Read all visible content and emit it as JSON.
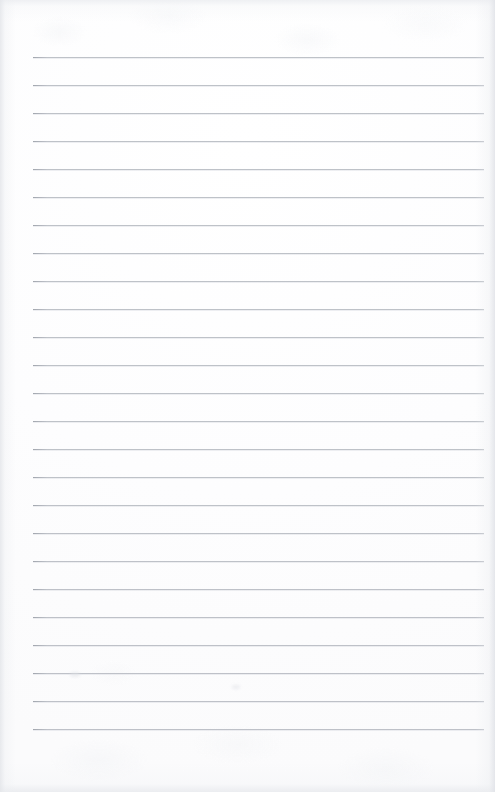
{
  "document": {
    "kind": "lined-paper-scan",
    "title": "Blank ruled notepad page",
    "description": "A scanned blank sheet of ruled (lined) writing paper. No text, headings, or marks are present — only horizontal ruling lines on near-white paper.",
    "page_width": 495,
    "page_height": 792,
    "content_text": "",
    "has_text": false,
    "has_margin_rule": false,
    "has_holes": false
  },
  "paper": {
    "background_color": "#fdfdfe",
    "edge_shadow_color": "#e4e6ea",
    "texture_note": "faint mottled scanner texture at top and bottom edges"
  },
  "ruling": {
    "line_color": "#b9bdc4",
    "line_thickness_px": 1,
    "line_count": 25,
    "line_spacing_px": 28,
    "first_line_y": 57,
    "last_line_y": 729,
    "line_start_x": 33,
    "line_end_x": 484,
    "line_length_px": 451,
    "left_margin_px": 33,
    "right_margin_px": 11,
    "top_margin_px": 57,
    "bottom_margin_px": 63,
    "lines": [
      {
        "index": 1,
        "y": 57,
        "content": ""
      },
      {
        "index": 2,
        "y": 85,
        "content": ""
      },
      {
        "index": 3,
        "y": 113,
        "content": ""
      },
      {
        "index": 4,
        "y": 141,
        "content": ""
      },
      {
        "index": 5,
        "y": 169,
        "content": ""
      },
      {
        "index": 6,
        "y": 197,
        "content": ""
      },
      {
        "index": 7,
        "y": 225,
        "content": ""
      },
      {
        "index": 8,
        "y": 253,
        "content": ""
      },
      {
        "index": 9,
        "y": 281,
        "content": ""
      },
      {
        "index": 10,
        "y": 309,
        "content": ""
      },
      {
        "index": 11,
        "y": 337,
        "content": ""
      },
      {
        "index": 12,
        "y": 365,
        "content": ""
      },
      {
        "index": 13,
        "y": 393,
        "content": ""
      },
      {
        "index": 14,
        "y": 421,
        "content": ""
      },
      {
        "index": 15,
        "y": 449,
        "content": ""
      },
      {
        "index": 16,
        "y": 477,
        "content": ""
      },
      {
        "index": 17,
        "y": 505,
        "content": ""
      },
      {
        "index": 18,
        "y": 533,
        "content": ""
      },
      {
        "index": 19,
        "y": 561,
        "content": ""
      },
      {
        "index": 20,
        "y": 589,
        "content": ""
      },
      {
        "index": 21,
        "y": 617,
        "content": ""
      },
      {
        "index": 22,
        "y": 645,
        "content": ""
      },
      {
        "index": 23,
        "y": 673,
        "content": ""
      },
      {
        "index": 24,
        "y": 701,
        "content": ""
      },
      {
        "index": 25,
        "y": 729,
        "content": ""
      }
    ]
  },
  "artifacts": [
    {
      "name": "smudge-upper-left",
      "x": 70,
      "y": 672,
      "width": 10,
      "height": 5
    },
    {
      "name": "smudge-lower-mid",
      "x": 232,
      "y": 685,
      "width": 8,
      "height": 4
    }
  ]
}
